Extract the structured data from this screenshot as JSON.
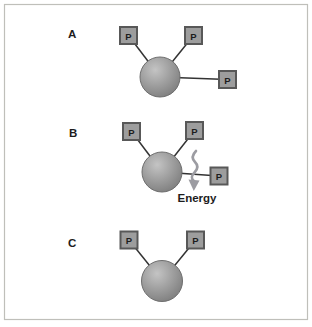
{
  "diagram": {
    "panel_a": {
      "label": "A",
      "phosphate_label": "P",
      "phosphate_count": 3
    },
    "panel_b": {
      "label": "B",
      "phosphate_label": "P",
      "phosphate_count": 3,
      "energy_label": "Energy"
    },
    "panel_c": {
      "label": "C",
      "phosphate_label": "P",
      "phosphate_count": 2
    }
  },
  "colors": {
    "background": "#ffffff",
    "frame_border": "#bfbfba",
    "bond_line": "#333333",
    "box_fill": "#9d9d9d",
    "box_border": "#585858",
    "box_letter": "#1d1d1d",
    "sphere_highlight": "#c4c4c4",
    "sphere_mid": "#a0a0a0",
    "sphere_edge": "#7a7a7a",
    "sphere_outline": "#6e6e6e",
    "squiggle": "#9c9ca2",
    "label_text": "#1d1d1d"
  }
}
